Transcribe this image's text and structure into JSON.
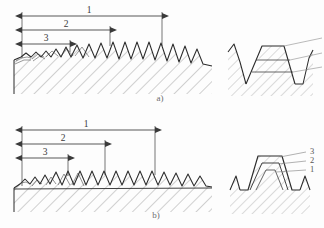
{
  "figure": {
    "background_color": "#fdfdfd",
    "line_color": "#2b2b2b",
    "hatch_color": "#9a9a9a",
    "dim_color": "#3a3a3a"
  },
  "panel_a": {
    "caption": "a)",
    "scheme": "profile-cutting-stepped-depth",
    "dimensions": [
      {
        "label": "1",
        "x1": 22,
        "x2": 162,
        "y": 16
      },
      {
        "label": "2",
        "x1": 22,
        "x2": 110,
        "y": 30
      },
      {
        "label": "3",
        "x1": 22,
        "x2": 70,
        "y": 44
      }
    ],
    "detail": {
      "label_count": 3,
      "shape": "trapezoid-nested-layers"
    }
  },
  "panel_b": {
    "caption": "b)",
    "scheme": "generating-cutting-uniform-depth",
    "dimensions": [
      {
        "label": "1",
        "x1": 22,
        "x2": 155,
        "y": 130
      },
      {
        "label": "2",
        "x1": 22,
        "x2": 105,
        "y": 144
      },
      {
        "label": "3",
        "x1": 22,
        "x2": 68,
        "y": 158
      }
    ],
    "detail": {
      "labels": [
        "3",
        "2",
        "1"
      ],
      "shape": "trapezoid-nested-layers"
    }
  }
}
